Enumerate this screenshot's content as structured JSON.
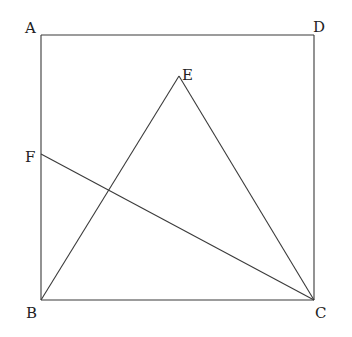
{
  "diagram": {
    "type": "geometry",
    "line_color": "#3a3a3a",
    "points": {
      "A": {
        "label": "A",
        "x": 41,
        "y": 35
      },
      "D": {
        "label": "D",
        "x": 314,
        "y": 35
      },
      "B": {
        "label": "B",
        "x": 41,
        "y": 300
      },
      "C": {
        "label": "C",
        "x": 314,
        "y": 300
      },
      "E": {
        "label": "E",
        "x": 179,
        "y": 76
      },
      "F": {
        "label": "F",
        "x": 41,
        "y": 154
      }
    },
    "segments": [
      [
        "A",
        "D"
      ],
      [
        "D",
        "C"
      ],
      [
        "C",
        "B"
      ],
      [
        "B",
        "A"
      ],
      [
        "B",
        "E"
      ],
      [
        "E",
        "C"
      ],
      [
        "F",
        "C"
      ]
    ],
    "labels": {
      "A": "A",
      "B": "B",
      "C": "C",
      "D": "D",
      "E": "E",
      "F": "F"
    }
  }
}
